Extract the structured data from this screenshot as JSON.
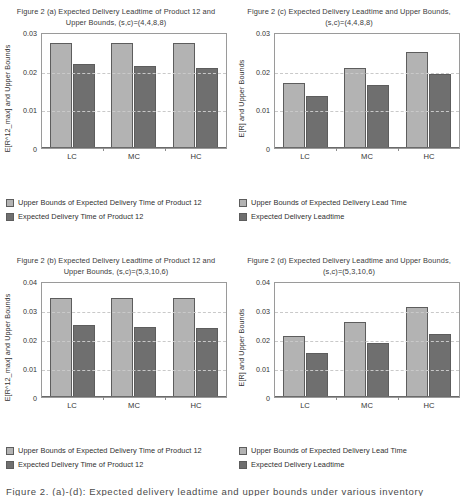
{
  "figure": {
    "caption_cut": "Figure 2. (a)-(d): Expected delivery leadtime and upper bounds under various inventory"
  },
  "panels": [
    {
      "key": "a",
      "title": "Figure 2 (a) Expected Delivery Leadtime of Product 12 and Upper Bounds, (s,c)=(4,4,8,8)",
      "legend": [
        "Upper Bounds of Expected Delivery Time of Product 12",
        "Expected Delivery Time of Product 12"
      ],
      "chart_data": {
        "type": "bar",
        "title": "Figure 2 (a) Expected Delivery Leadtime of Product 12 and Upper Bounds, (s,c)=(4,4,8,8)",
        "xlabel": "",
        "ylabel": "E[R^12_max] and Upper Bounds",
        "categories": [
          "LC",
          "MC",
          "HC"
        ],
        "ylim": [
          0,
          0.03
        ],
        "yticks": [
          0,
          0.01,
          0.02,
          0.03
        ],
        "ytick_labels": [
          "0",
          "0.01",
          "0.02",
          "0.03"
        ],
        "grid": true,
        "legend_position": "below",
        "series": [
          {
            "name": "Upper Bounds of Expected Delivery Time of Product 12",
            "color": "#b3b3b3",
            "values": [
              0.0272,
              0.0272,
              0.0272
            ]
          },
          {
            "name": "Expected Delivery Time of Product 12",
            "color": "#6f6f6f",
            "values": [
              0.0218,
              0.0212,
              0.0207
            ]
          }
        ]
      }
    },
    {
      "key": "c",
      "title": "Figure 2 (c) Expected Delivery Leadtime and Upper Bounds, (s,c)=(4,4,8,8)",
      "legend": [
        "Upper Bounds of Expected Delivery Lead Time",
        "Expected Delivery Leadtime"
      ],
      "chart_data": {
        "type": "bar",
        "title": "Figure 2 (c) Expected Delivery Leadtime and Upper Bounds, (s,c)=(4,4,8,8)",
        "xlabel": "",
        "ylabel": "E[R] and Upper Bounds",
        "categories": [
          "LC",
          "MC",
          "HC"
        ],
        "ylim": [
          0,
          0.03
        ],
        "yticks": [
          0,
          0.01,
          0.02,
          0.03
        ],
        "ytick_labels": [
          "0",
          "0.01",
          "0.02",
          "0.03"
        ],
        "grid": true,
        "legend_position": "below",
        "series": [
          {
            "name": "Upper Bounds of Expected Delivery Lead Time",
            "color": "#b3b3b3",
            "values": [
              0.0167,
              0.0207,
              0.0249
            ]
          },
          {
            "name": "Expected Delivery Leadtime",
            "color": "#6f6f6f",
            "values": [
              0.0134,
              0.0163,
              0.0191
            ]
          }
        ]
      }
    },
    {
      "key": "b",
      "title": "Figure 2 (b) Expected Delivery Leadtime of Product 12 and Upper Bounds, (s,c)=(5,3,10,6)",
      "legend": [
        "Upper Bounds of Expected Delivery Time of Product 12",
        "Expected Delivery Time of Product 12"
      ],
      "chart_data": {
        "type": "bar",
        "title": "Figure 2 (b) Expected Delivery Leadtime of Product 12 and Upper Bounds, (s,c)=(5,3,10,6)",
        "xlabel": "",
        "ylabel": "E[R^12_max] and Upper Bounds",
        "categories": [
          "LC",
          "MC",
          "HC"
        ],
        "ylim": [
          0,
          0.04
        ],
        "yticks": [
          0,
          0.01,
          0.02,
          0.03,
          0.04
        ],
        "ytick_labels": [
          "0",
          "0.01",
          "0.02",
          "0.03",
          "0.04"
        ],
        "grid": true,
        "legend_position": "below",
        "series": [
          {
            "name": "Upper Bounds of Expected Delivery Time of Product 12",
            "color": "#b3b3b3",
            "values": [
              0.034,
              0.034,
              0.034
            ]
          },
          {
            "name": "Expected Delivery Time of Product 12",
            "color": "#6f6f6f",
            "values": [
              0.025,
              0.0241,
              0.0239
            ]
          }
        ]
      }
    },
    {
      "key": "d",
      "title": "Figure 2 (d) Expected Delivery Leadtime and Upper Bounds, (s,c)=(5,3,10,6)",
      "legend": [
        "Upper Bounds of Expected Delivery Lead Time",
        "Expected Delivery Leadtime"
      ],
      "chart_data": {
        "type": "bar",
        "title": "Figure 2 (d) Expected Delivery Leadtime and Upper Bounds, (s,c)=(5,3,10,6)",
        "xlabel": "",
        "ylabel": "E[R] and Upper Bounds",
        "categories": [
          "LC",
          "MC",
          "HC"
        ],
        "ylim": [
          0,
          0.04
        ],
        "yticks": [
          0,
          0.01,
          0.02,
          0.03,
          0.04
        ],
        "ytick_labels": [
          "0",
          "0.01",
          "0.02",
          "0.03",
          "0.04"
        ],
        "grid": true,
        "legend_position": "below",
        "series": [
          {
            "name": "Upper Bounds of Expected Delivery Lead Time",
            "color": "#b3b3b3",
            "values": [
              0.021,
              0.026,
              0.0311
            ]
          },
          {
            "name": "Expected Delivery Leadtime",
            "color": "#6f6f6f",
            "values": [
              0.0152,
              0.0187,
              0.0218
            ]
          }
        ]
      }
    }
  ]
}
